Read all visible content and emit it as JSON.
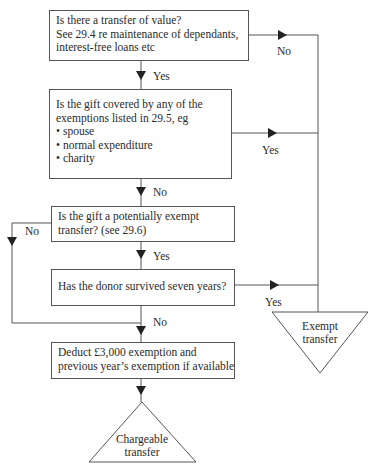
{
  "diagram": {
    "type": "flowchart",
    "header_cut_text": "gift-chargeability flowchart",
    "nodes": {
      "transfer_of_value": {
        "lines": [
          "Is there a transfer of value?",
          "See 29.4 re maintenance of dependants,",
          "interest-free loans etc"
        ]
      },
      "exemptions": {
        "lines": [
          "Is the gift covered by any of the",
          "exemptions listed in 29.5, eg"
        ],
        "bullets": [
          "spouse",
          "normal expenditure",
          "charity"
        ]
      },
      "pet": {
        "lines": [
          "Is the gift a potentially exempt",
          "transfer? (see 29.6)"
        ]
      },
      "seven_years": {
        "lines": [
          "Has the donor survived seven years?"
        ]
      },
      "deduct": {
        "lines": [
          "Deduct £3,000 exemption and",
          "previous year’s exemption if available"
        ]
      },
      "exempt_transfer": {
        "lines": [
          "Exempt",
          "transfer"
        ]
      },
      "chargeable_transfer": {
        "lines": [
          "Chargeable",
          "transfer"
        ]
      }
    },
    "edges": {
      "transfer_no": "No",
      "transfer_yes": "Yes",
      "exemptions_yes": "Yes",
      "exemptions_no": "No",
      "pet_no": "No",
      "pet_yes": "Yes",
      "seven_yes": "Yes",
      "seven_no": "No"
    },
    "bullet_glyph": "•",
    "colors": {
      "line": "#555555",
      "text": "#2a2a2a",
      "background": "#ffffff"
    }
  }
}
